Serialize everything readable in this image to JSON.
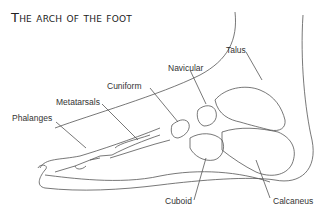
{
  "title": "The arch of the foot",
  "colors": {
    "line": "#555555",
    "text": "#333333",
    "title": "#222222",
    "background": "#ffffff"
  },
  "labels": {
    "talus": "Talus",
    "navicular": "Navicular",
    "cuniform": "Cuniform",
    "metatarsals": "Metatarsals",
    "phalanges": "Phalanges",
    "cuboid": "Cuboid",
    "calcaneus": "Calcaneus"
  }
}
